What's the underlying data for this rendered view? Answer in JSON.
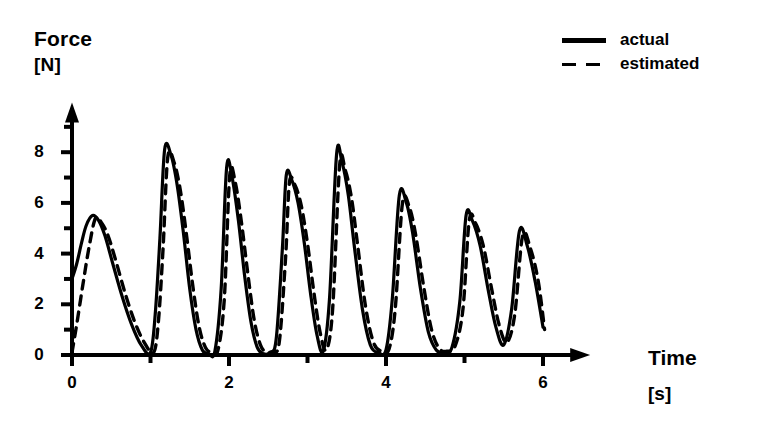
{
  "axes": {
    "y_title": "Force",
    "y_unit": "[N]",
    "x_title": "Time",
    "x_unit": "[s]"
  },
  "legend": {
    "items": [
      {
        "label": "actual",
        "style": "solid",
        "swatch": "solid-line-swatch"
      },
      {
        "label": "estimated",
        "style": "dashed",
        "swatch": "dashed-line-swatch"
      }
    ]
  },
  "chart_data": {
    "type": "line",
    "title": "",
    "subtitle": "",
    "xlabel": "Time",
    "xunit": "[s]",
    "ylabel": "Force",
    "yunit": "[N]",
    "xlim": [
      0,
      6.6
    ],
    "ylim": [
      -0.6,
      9.6
    ],
    "xticks_major": [
      0,
      2,
      4,
      6
    ],
    "xticks_major_labels": [
      "0",
      "2",
      "4",
      "6"
    ],
    "xticks_minor": [
      1,
      3,
      5
    ],
    "yticks_major": [
      0,
      2,
      4,
      6,
      8
    ],
    "yticks_major_labels": [
      "0",
      "2",
      "4",
      "6",
      "8"
    ],
    "yticks_minor": [
      1,
      3,
      5,
      7,
      9
    ],
    "grid": false,
    "legend_position": "top-right",
    "peaks": [
      {
        "t": 0.26,
        "actual": 5.5,
        "estimated": 5.4
      },
      {
        "t": 1.18,
        "actual": 8.1,
        "estimated": 7.8
      },
      {
        "t": 1.97,
        "actual": 7.4,
        "estimated": 7.1
      },
      {
        "t": 2.73,
        "actual": 7.1,
        "estimated": 6.8
      },
      {
        "t": 3.37,
        "actual": 7.9,
        "estimated": 7.5
      },
      {
        "t": 4.17,
        "actual": 6.3,
        "estimated": 6.0
      },
      {
        "t": 5.02,
        "actual": 5.5,
        "estimated": 5.3
      },
      {
        "t": 5.7,
        "actual": 4.9,
        "estimated": 4.7
      }
    ],
    "series": [
      {
        "name": "actual",
        "style": "solid",
        "x": [
          0.0,
          0.06,
          0.12,
          0.18,
          0.26,
          0.34,
          0.42,
          0.52,
          0.64,
          0.76,
          0.88,
          1.0,
          1.06,
          1.12,
          1.18,
          1.26,
          1.34,
          1.42,
          1.5,
          1.58,
          1.66,
          1.74,
          1.82,
          1.9,
          1.97,
          2.04,
          2.12,
          2.2,
          2.28,
          2.36,
          2.44,
          2.52,
          2.6,
          2.68,
          2.73,
          2.8,
          2.88,
          2.96,
          3.04,
          3.12,
          3.2,
          3.28,
          3.37,
          3.44,
          3.52,
          3.6,
          3.7,
          3.8,
          3.9,
          4.0,
          4.08,
          4.17,
          4.26,
          4.34,
          4.44,
          4.54,
          4.64,
          4.74,
          4.84,
          4.94,
          5.02,
          5.1,
          5.2,
          5.3,
          5.4,
          5.5,
          5.6,
          5.7,
          5.8,
          5.9,
          6.0
        ],
        "y": [
          3.0,
          3.6,
          4.4,
          5.1,
          5.5,
          5.3,
          4.7,
          3.6,
          2.3,
          1.2,
          0.4,
          0.1,
          1.6,
          4.6,
          8.1,
          7.9,
          6.7,
          4.8,
          2.6,
          1.0,
          0.2,
          0.05,
          0.15,
          2.6,
          7.4,
          7.0,
          5.3,
          3.1,
          1.3,
          0.3,
          0.05,
          0.1,
          0.6,
          4.2,
          7.1,
          6.9,
          6.0,
          4.4,
          2.4,
          0.8,
          0.15,
          2.2,
          7.9,
          7.6,
          6.3,
          4.2,
          1.8,
          0.4,
          0.1,
          0.2,
          2.2,
          6.3,
          6.0,
          4.8,
          2.6,
          0.9,
          0.2,
          0.1,
          0.3,
          2.1,
          5.5,
          5.3,
          4.3,
          2.6,
          1.1,
          0.4,
          1.8,
          4.9,
          4.3,
          2.9,
          1.1
        ]
      },
      {
        "name": "estimated",
        "style": "dashed",
        "x": [
          0.0,
          0.06,
          0.14,
          0.22,
          0.3,
          0.38,
          0.46,
          0.56,
          0.68,
          0.8,
          0.92,
          1.04,
          1.1,
          1.16,
          1.22,
          1.3,
          1.38,
          1.46,
          1.54,
          1.62,
          1.7,
          1.78,
          1.86,
          1.94,
          2.01,
          2.08,
          2.16,
          2.24,
          2.32,
          2.4,
          2.48,
          2.56,
          2.64,
          2.72,
          2.77,
          2.84,
          2.92,
          3.0,
          3.08,
          3.16,
          3.24,
          3.32,
          3.41,
          3.48,
          3.56,
          3.64,
          3.74,
          3.84,
          3.94,
          4.04,
          4.12,
          4.21,
          4.3,
          4.38,
          4.48,
          4.58,
          4.68,
          4.78,
          4.88,
          4.98,
          5.06,
          5.14,
          5.24,
          5.34,
          5.44,
          5.54,
          5.64,
          5.74,
          5.84,
          5.94,
          6.02
        ],
        "y": [
          0.1,
          1.2,
          2.8,
          4.3,
          5.4,
          5.2,
          4.7,
          3.7,
          2.4,
          1.3,
          0.5,
          0.1,
          1.3,
          4.2,
          7.8,
          7.6,
          6.5,
          4.7,
          2.7,
          1.1,
          0.3,
          0.1,
          0.2,
          2.2,
          7.1,
          6.8,
          5.2,
          3.2,
          1.4,
          0.4,
          0.1,
          0.15,
          0.5,
          3.8,
          6.8,
          6.7,
          5.9,
          4.4,
          2.5,
          0.9,
          0.2,
          1.8,
          7.5,
          7.3,
          6.2,
          4.3,
          1.9,
          0.5,
          0.15,
          0.25,
          1.9,
          6.0,
          5.8,
          4.7,
          2.7,
          1.0,
          0.25,
          0.15,
          0.35,
          1.8,
          5.3,
          5.2,
          4.3,
          2.7,
          1.2,
          0.5,
          1.6,
          4.7,
          4.2,
          2.9,
          1.0
        ]
      }
    ]
  }
}
